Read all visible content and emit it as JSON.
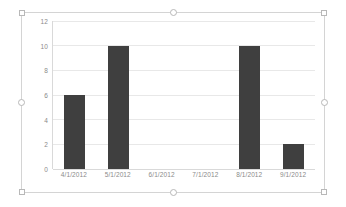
{
  "chart_data": {
    "type": "bar",
    "title": "",
    "subtitle": "",
    "xlabel": "",
    "ylabel": "",
    "categories": [
      "4/1/2012",
      "5/1/2012",
      "6/1/2012",
      "7/1/2012",
      "8/1/2012",
      "9/1/2012"
    ],
    "values": [
      6,
      10,
      0,
      0,
      10,
      2
    ],
    "series": [
      {
        "name": "",
        "values": [
          6,
          10,
          0,
          0,
          10,
          2
        ]
      }
    ],
    "ylim": [
      0,
      12
    ],
    "y_ticks": [
      0,
      2,
      4,
      6,
      8,
      10,
      12
    ],
    "y_tick_labels": [
      "0",
      "2",
      "4",
      "6",
      "8",
      "10",
      "12"
    ],
    "grid": true,
    "grid_axis": "y",
    "legend": false,
    "legend_position": "none",
    "bar_color": "#3f3f3f",
    "gridline_color": "#e8e8e8",
    "axis_line_color": "#d9d9d9",
    "tick_label_color": "#8a8a8a",
    "plot_background": "#ffffff"
  },
  "chart_object": {
    "selected": true,
    "border_color": "#d4d4d4",
    "handle_fill": "#ffffff",
    "handle_border": "#b8b8b8",
    "handles": [
      {
        "name": "handle-top-left",
        "shape": "square"
      },
      {
        "name": "handle-top-center",
        "shape": "round"
      },
      {
        "name": "handle-top-right",
        "shape": "square"
      },
      {
        "name": "handle-middle-left",
        "shape": "round"
      },
      {
        "name": "handle-middle-right",
        "shape": "round"
      },
      {
        "name": "handle-bottom-left",
        "shape": "square"
      },
      {
        "name": "handle-bottom-center",
        "shape": "round"
      },
      {
        "name": "handle-bottom-right",
        "shape": "square"
      }
    ]
  }
}
